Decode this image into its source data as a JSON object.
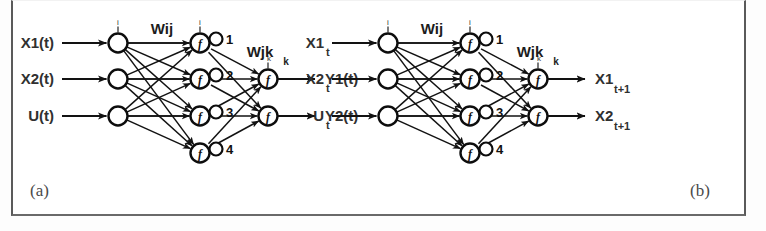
{
  "figure": {
    "background_color": "#ffffff",
    "frame_color": "#5a5a5a",
    "ink_color": "#121212"
  },
  "panels": [
    {
      "id": "a",
      "caption": "(a)",
      "origin_x": 0,
      "inputs": [
        {
          "label": "X1",
          "subscript": "",
          "paren": "(t)"
        },
        {
          "label": "X2",
          "subscript": "",
          "paren": "(t)"
        },
        {
          "label": "U",
          "subscript": "",
          "paren": "(t)"
        }
      ],
      "outputs": [
        {
          "label": "Y1",
          "subscript": "",
          "paren": "(t)"
        },
        {
          "label": "Y2",
          "subscript": "",
          "paren": "(t)"
        }
      ],
      "weights": [
        {
          "name": "Wij",
          "subscript": ""
        },
        {
          "name": "Wjk",
          "subscript": "k"
        }
      ],
      "hidden_indices": [
        "1",
        "2",
        "3",
        "4"
      ],
      "node_function_glyph": "f",
      "input_tick": "i",
      "hidden_tick": "i",
      "output_tick": "k"
    },
    {
      "id": "b",
      "caption": "(b)",
      "origin_x": 270,
      "inputs": [
        {
          "label": "X1",
          "subscript": "t",
          "paren": ""
        },
        {
          "label": "X2",
          "subscript": "t",
          "paren": ""
        },
        {
          "label": "U",
          "subscript": "t",
          "paren": ""
        }
      ],
      "outputs": [
        {
          "label": "X1",
          "subscript": "t+1",
          "paren": ""
        },
        {
          "label": "X2",
          "subscript": "t+1",
          "paren": ""
        }
      ],
      "weights": [
        {
          "name": "Wij",
          "subscript": ""
        },
        {
          "name": "Wjk",
          "subscript": "k"
        }
      ],
      "hidden_indices": [
        "1",
        "2",
        "3",
        "4"
      ],
      "node_function_glyph": "f",
      "input_tick": "i",
      "hidden_tick": "i",
      "output_tick": "k"
    }
  ],
  "geometry": {
    "input_x": 118,
    "hidden_x": 200,
    "output_x": 268,
    "input_y": [
      43,
      79,
      116
    ],
    "hidden_y": [
      43,
      79,
      116,
      153
    ],
    "output_y": [
      79,
      116
    ],
    "node_r": 9.5,
    "badge_r": 6.5,
    "arrow_start_x": 62,
    "arrow_end_x": 315,
    "caption_a_x": 30,
    "caption_b_x": 700,
    "caption_y": 196
  }
}
